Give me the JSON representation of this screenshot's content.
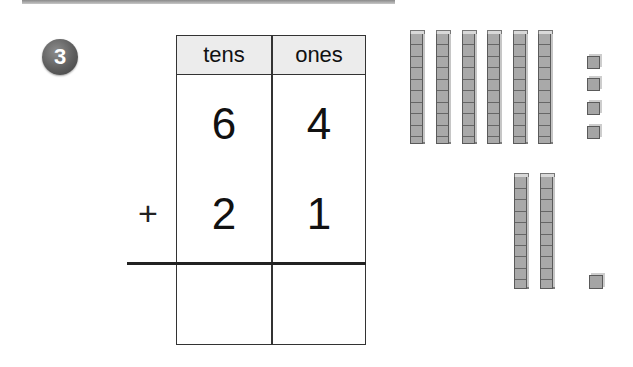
{
  "problem": {
    "number": "3",
    "operator": "+"
  },
  "place_value_chart": {
    "headers": [
      "tens",
      "ones"
    ],
    "rows": [
      {
        "tens": "6",
        "ones": "4"
      },
      {
        "tens": "2",
        "ones": "1"
      }
    ],
    "answer": {
      "tens": "",
      "ones": ""
    }
  },
  "base_ten_blocks": {
    "addend1": {
      "tens_rods": 6,
      "ones_units": 4
    },
    "addend2": {
      "tens_rods": 2,
      "ones_units": 1
    }
  },
  "colors": {
    "badge": "#5e5e5e",
    "header_fill": "#ececec",
    "block": "#a9a9a9",
    "line": "#333333"
  }
}
